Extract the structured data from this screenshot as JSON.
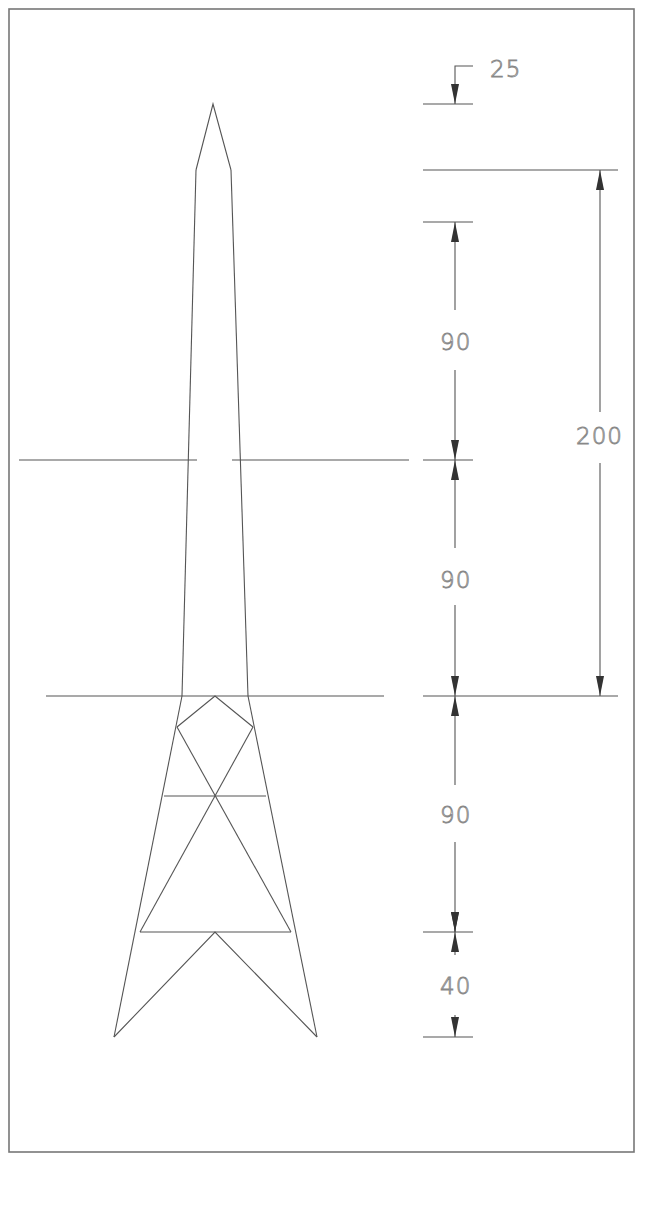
{
  "drawing": {
    "type": "engineering-elevation",
    "subject": "lattice tower / pylon elevation",
    "colors": {
      "line": "#555555",
      "frame": "#777777",
      "text": "#888888",
      "arrow": "#333333",
      "background": "#ffffff"
    }
  },
  "dimensions": {
    "top_offset": {
      "label": "25"
    },
    "overall_upper": {
      "label": "200"
    },
    "upper_mast": {
      "label": "90"
    },
    "middle_mast": {
      "label": "90"
    },
    "lattice_section": {
      "label": "90"
    },
    "base_legs": {
      "label": "40"
    }
  },
  "levels": [
    {
      "name": "tip",
      "y": 104
    },
    {
      "name": "top-datum",
      "y": 170
    },
    {
      "name": "upper-datum",
      "y": 222
    },
    {
      "name": "crossarm-1",
      "y": 460
    },
    {
      "name": "crossarm-2",
      "y": 696
    },
    {
      "name": "lattice-brace",
      "y": 932
    },
    {
      "name": "base",
      "y": 1037
    }
  ]
}
